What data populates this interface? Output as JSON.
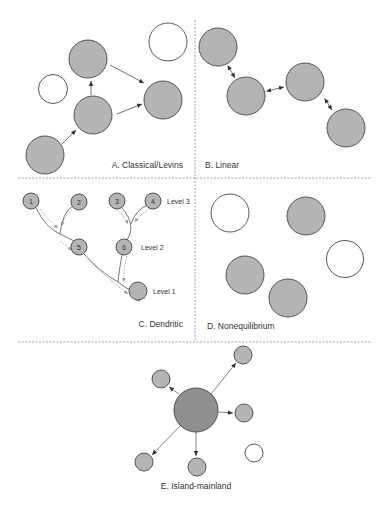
{
  "colors": {
    "gray_fill": "#b4b4b4",
    "mainland_fill": "#8f8f8f",
    "white_fill": "#ffffff",
    "stroke": "#444444",
    "divider": "#888888",
    "dendritic_arrow": "#9a9a9a"
  },
  "panels": {
    "A": {
      "label": "A. Classical/Levins"
    },
    "B": {
      "label": "B. Linear"
    },
    "C": {
      "label": "C. Dendritic",
      "nodes": [
        "1",
        "2",
        "3",
        "4",
        "5",
        "6"
      ],
      "levels": [
        "Level 3",
        "Level 2",
        "Level 1"
      ]
    },
    "D": {
      "label": "D. Nonequilibrium"
    },
    "E": {
      "label": "E. Island-mainland"
    }
  }
}
